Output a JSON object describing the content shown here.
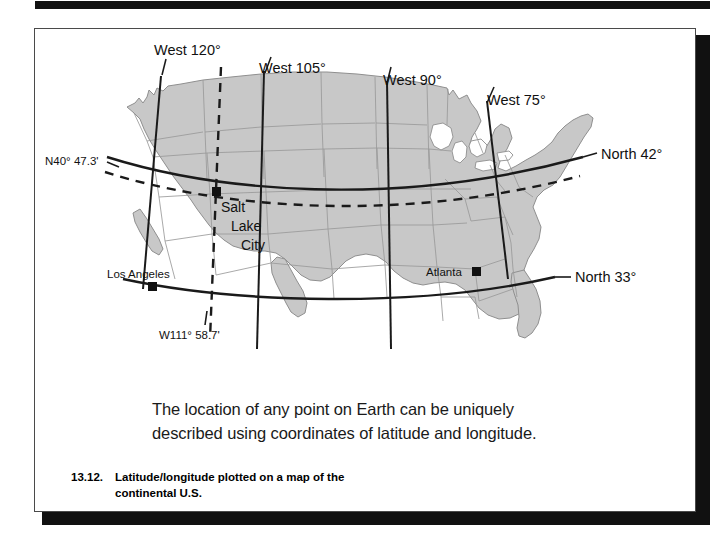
{
  "figure": {
    "number": "13.12.",
    "caption_line1": "Latitude/longitude plotted on a map of the",
    "caption_line2": "continental U.S.",
    "body_line1": "The location of any point on Earth can be uniquely",
    "body_line2": "described using coordinates of latitude and longitude."
  },
  "map": {
    "title": "Latitude/longitude plotted on a map of the continental U.S.",
    "land_fill": "#c8c8c8",
    "land_stroke": "#8f8f8f",
    "grid_stroke": "#1a1a1a",
    "longitude_labels": [
      {
        "id": "west-120",
        "text": "West 120°"
      },
      {
        "id": "west-105",
        "text": "West 105°"
      },
      {
        "id": "west-90",
        "text": "West 90°"
      },
      {
        "id": "west-75",
        "text": "West 75°"
      }
    ],
    "latitude_labels": [
      {
        "id": "north-42",
        "text": "North 42°"
      },
      {
        "id": "north-33",
        "text": "North 33°"
      }
    ],
    "coordinate_callouts": [
      {
        "id": "latitude-callout",
        "text": "N40° 47.3'"
      },
      {
        "id": "longitude-callout",
        "text": "W111° 58.7'"
      }
    ],
    "cities": [
      {
        "id": "salt-lake-city",
        "line1": "Salt",
        "line2": "Lake",
        "line3": "City"
      },
      {
        "id": "los-angeles",
        "label": "Los Angeles"
      },
      {
        "id": "atlanta",
        "label": "Atlanta"
      }
    ]
  }
}
